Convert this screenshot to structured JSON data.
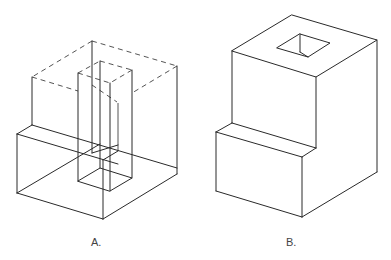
{
  "figures": [
    {
      "id": "A",
      "label": "A.",
      "description": "Wireframe isometric view with hidden (dashed) edges of removed material and a vertical square column"
    },
    {
      "id": "B",
      "label": "B.",
      "description": "Solid isometric view of stepped block with a square hole through the top"
    }
  ],
  "colors": {
    "line": "#2a2a2a",
    "hidden_line": "#555555",
    "background": "#ffffff"
  }
}
